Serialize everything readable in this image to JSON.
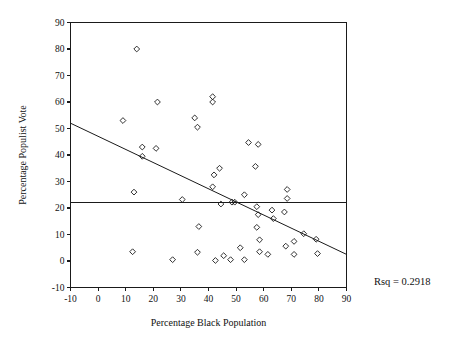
{
  "chart_data": {
    "type": "scatter",
    "title": "",
    "xlabel": "Percentage Black Population",
    "ylabel": "Percentage Populist Vote",
    "xlim": [
      -10,
      90
    ],
    "ylim": [
      -10,
      90
    ],
    "xticks": [
      -10,
      0,
      10,
      20,
      30,
      40,
      50,
      60,
      70,
      80,
      90
    ],
    "yticks": [
      -10,
      0,
      10,
      20,
      30,
      40,
      50,
      60,
      70,
      80,
      90
    ],
    "xtick_labels": [
      "-10",
      "0",
      "10",
      "20",
      "30",
      "40",
      "50",
      "60",
      "70",
      "80",
      "90"
    ],
    "ytick_labels": [
      "-10",
      "0",
      "10",
      "20",
      "30",
      "40",
      "50",
      "60",
      "70",
      "80",
      "90"
    ],
    "grid": false,
    "legend": false,
    "marker": "open-diamond",
    "marker_color": "#1a1a1a",
    "points": [
      [
        14,
        80
      ],
      [
        21.5,
        60
      ],
      [
        41.5,
        62
      ],
      [
        41.5,
        60
      ],
      [
        35,
        54
      ],
      [
        9,
        53
      ],
      [
        36,
        50.5
      ],
      [
        16,
        43
      ],
      [
        21,
        42.5
      ],
      [
        16,
        39.5
      ],
      [
        54.5,
        44.7
      ],
      [
        58,
        44
      ],
      [
        57,
        35.7
      ],
      [
        44,
        35
      ],
      [
        42,
        32.5
      ],
      [
        41.5,
        28
      ],
      [
        68.5,
        27
      ],
      [
        13,
        26
      ],
      [
        53,
        25
      ],
      [
        68.5,
        23.6
      ],
      [
        30.5,
        23.2
      ],
      [
        48.5,
        22.2
      ],
      [
        49.5,
        22.2
      ],
      [
        44.5,
        21.5
      ],
      [
        57.5,
        20.5
      ],
      [
        63,
        19.2
      ],
      [
        67.5,
        18.5
      ],
      [
        58,
        17.5
      ],
      [
        63.5,
        16
      ],
      [
        36.5,
        13
      ],
      [
        57.5,
        12.7
      ],
      [
        74.5,
        10.3
      ],
      [
        58.5,
        8
      ],
      [
        79,
        8.2
      ],
      [
        71,
        7.4
      ],
      [
        68,
        5.6
      ],
      [
        51.5,
        5
      ],
      [
        12.5,
        3.5
      ],
      [
        36,
        3.3
      ],
      [
        58.5,
        3.5
      ],
      [
        61.5,
        2.5
      ],
      [
        71,
        2.5
      ],
      [
        79.5,
        2.8
      ],
      [
        45.5,
        2
      ],
      [
        27,
        0.5
      ],
      [
        42.5,
        0.2
      ],
      [
        48,
        0.5
      ],
      [
        53,
        0.5
      ]
    ],
    "fit_line": {
      "name": "regression-line",
      "x": [
        -10,
        90
      ],
      "y": [
        52,
        2.5
      ]
    },
    "reference_line": {
      "name": "mean-line",
      "orientation": "horizontal",
      "y": 22
    },
    "annotations": [
      {
        "name": "rsq-annotation",
        "text": "Rsq = 0.2918",
        "x": 97,
        "y": -5
      }
    ]
  }
}
